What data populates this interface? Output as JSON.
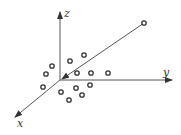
{
  "diagram": {
    "type": "3d-axes-scatter",
    "origin": [
      60,
      80
    ],
    "axes": [
      {
        "name": "z",
        "label": "z",
        "end": [
          60,
          12
        ],
        "label_pos": [
          64,
          17
        ]
      },
      {
        "name": "y",
        "label": "y",
        "end": [
          172,
          80
        ],
        "label_pos": [
          163,
          76
        ]
      },
      {
        "name": "x",
        "label": "x",
        "end": [
          15,
          117
        ],
        "label_pos": [
          17,
          127
        ]
      }
    ],
    "vector_line": {
      "from": [
        144,
        23
      ],
      "to": [
        62,
        79
      ]
    },
    "points": [
      [
        144,
        23
      ],
      [
        52,
        66
      ],
      [
        46,
        74
      ],
      [
        70,
        61
      ],
      [
        84,
        55
      ],
      [
        77,
        73
      ],
      [
        91,
        73
      ],
      [
        108,
        73
      ],
      [
        43,
        87
      ],
      [
        61,
        92
      ],
      [
        76,
        88
      ],
      [
        90,
        85
      ],
      [
        69,
        100
      ],
      [
        82,
        95
      ]
    ],
    "colors": {
      "line": "#555555",
      "point_stroke": "#333333"
    }
  }
}
